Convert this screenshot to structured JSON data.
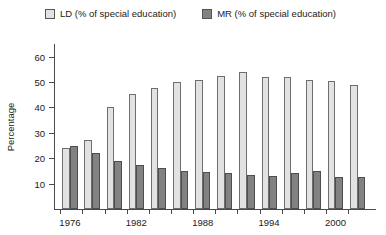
{
  "legend": {
    "entries": [
      {
        "label": "LD (% of special education)",
        "key": "LD",
        "color": "#e2e2e2"
      },
      {
        "label": "MR (% of special education)",
        "key": "MR",
        "color": "#828282"
      }
    ]
  },
  "axes": {
    "ylabel": "Percentage",
    "yticks": [
      "10",
      "20",
      "30",
      "40",
      "50",
      "60"
    ],
    "xticklabels": [
      "1976",
      "1982",
      "1988",
      "1994",
      "2000"
    ]
  },
  "chart_data": {
    "type": "bar",
    "title": "",
    "subtitle": "",
    "xlabel": "",
    "ylabel": "Percentage",
    "ylim": [
      0,
      65
    ],
    "yticks": [
      10,
      20,
      30,
      40,
      50,
      60
    ],
    "grid": false,
    "legend_position": "top",
    "categories": [
      "1976",
      "1977",
      "1978",
      "1979",
      "1980",
      "1981",
      "1982",
      "1983",
      "1984",
      "1985",
      "1986",
      "1987",
      "1988",
      "1989"
    ],
    "xtick_labels_shown": [
      "1976",
      "1982",
      "1988",
      "1994",
      "2000"
    ],
    "series": [
      {
        "name": "LD (% of special education)",
        "color": "#e2e2e2",
        "values": [
          24,
          27,
          40,
          45.5,
          47.5,
          50,
          51,
          52.5,
          54,
          52,
          52,
          51,
          50.5,
          49
        ]
      },
      {
        "name": "MR (% of special education)",
        "color": "#828282",
        "values": [
          25,
          22,
          19,
          17.5,
          16,
          15,
          14.5,
          14,
          13.5,
          13,
          14,
          15,
          12.5,
          12.5
        ]
      }
    ]
  }
}
